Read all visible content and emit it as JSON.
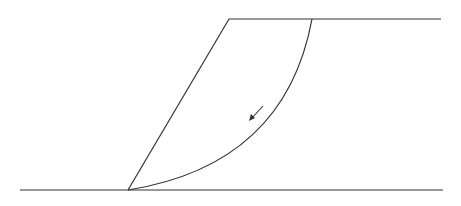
{
  "diagram": {
    "background": "#ffffff",
    "stroke_color": "#333333",
    "elements": {
      "ground_line": {
        "x1": 20,
        "y1": 190,
        "x2": 443,
        "y2": 190
      },
      "crest_line": {
        "x1": 229,
        "y1": 19,
        "x2": 441,
        "y2": 19
      },
      "slope_face": {
        "x1": 229,
        "y1": 19,
        "x2": 128,
        "y2": 190
      },
      "slip_surface": {
        "start": [
          128,
          190
        ],
        "end": [
          312,
          19
        ],
        "control": [
          280,
          160
        ]
      },
      "movement_arrow": {
        "from": [
          263,
          106
        ],
        "to": [
          250,
          120
        ]
      }
    }
  }
}
